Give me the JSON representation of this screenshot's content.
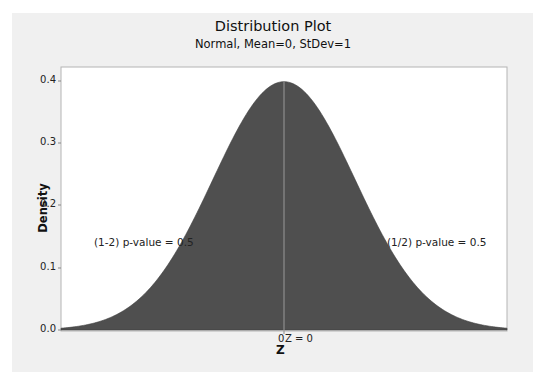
{
  "chart_data": {
    "type": "area",
    "title": "Distribution Plot",
    "subtitle": "Normal, Mean=0, StDev=1",
    "xlabel": "Z",
    "ylabel": "Density",
    "distribution": {
      "name": "Normal",
      "mean": 0,
      "stdev": 1
    },
    "xlim": [
      -3.14,
      3.14
    ],
    "ylim": [
      0.0,
      0.42
    ],
    "yticks": [
      0.0,
      0.1,
      0.2,
      0.3,
      0.4
    ],
    "ytick_labels": [
      "0.0",
      "0.1",
      "0.2",
      "0.3",
      "0.4"
    ],
    "xticks": [
      0
    ],
    "xtick_labels": [
      "0"
    ],
    "grid": false,
    "shaded_regions": [
      {
        "from": -3.14,
        "to": 0,
        "label": "(1-2) p-value = 0.5",
        "area": 0.5
      },
      {
        "from": 0,
        "to": 3.14,
        "label": "(1/2) p-value = 0.5",
        "area": 0.5
      }
    ],
    "reference_line": {
      "x": 0,
      "label": "Z = 0"
    },
    "fill_color": "#4f4f4f",
    "peak_density": 0.3989
  },
  "labels": {
    "title": "Distribution Plot",
    "subtitle": "Normal, Mean=0, StDev=1",
    "ylabel": "Density",
    "xlabel": "Z",
    "y0": "0.0",
    "y1": "0.1",
    "y2": "0.2",
    "y3": "0.3",
    "y4": "0.4",
    "x0": "0",
    "z_annotation": "Z = 0",
    "left_annotation": "(1-2) p-value = 0.5",
    "right_annotation": "(1/2) p-value = 0.5"
  }
}
